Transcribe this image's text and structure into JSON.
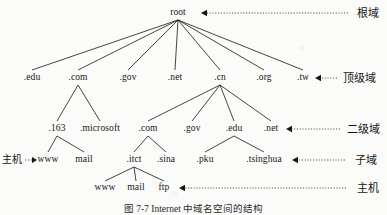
{
  "figure": {
    "caption": "图 7-7  Internet 中域名空间的结构",
    "width": 387,
    "height": 215,
    "ink_color": "#161616",
    "background": "#fbfbfa"
  },
  "nodes": {
    "root": {
      "label": "root",
      "x": 178,
      "y": 13
    },
    "tld": [
      {
        "label": ".edu",
        "x": 32,
        "y": 78
      },
      {
        "label": ".com",
        "x": 78,
        "y": 78
      },
      {
        "label": ".gov",
        "x": 128,
        "y": 78
      },
      {
        "label": ".net",
        "x": 175,
        "y": 78
      },
      {
        "label": ".cn",
        "x": 220,
        "y": 78
      },
      {
        "label": ".org",
        "x": 264,
        "y": 78
      },
      {
        "label": ".tw",
        "x": 303,
        "y": 78
      }
    ],
    "second_level": [
      {
        "label": ".163",
        "x": 57,
        "y": 129
      },
      {
        "label": ".microsoft",
        "x": 100,
        "y": 129
      },
      {
        "label": ".com",
        "x": 148,
        "y": 129
      },
      {
        "label": ".gov",
        "x": 192,
        "y": 129
      },
      {
        "label": ".edu",
        "x": 234,
        "y": 129
      },
      {
        "label": ".net",
        "x": 271,
        "y": 129
      }
    ],
    "sub_domain": [
      {
        "label": "www",
        "x": 48,
        "y": 160
      },
      {
        "label": "mail",
        "x": 84,
        "y": 160
      },
      {
        "label": ".itct",
        "x": 134,
        "y": 160
      },
      {
        "label": ".sina",
        "x": 166,
        "y": 160
      },
      {
        "label": ".pku",
        "x": 205,
        "y": 160
      },
      {
        "label": ".tsinghua",
        "x": 264,
        "y": 160
      }
    ],
    "host": [
      {
        "label": "www",
        "x": 105,
        "y": 188
      },
      {
        "label": "mail",
        "x": 136,
        "y": 188
      },
      {
        "label": "ftp",
        "x": 164,
        "y": 188
      }
    ]
  },
  "level_labels": [
    {
      "name": "root-domain",
      "text": "根域",
      "x": 357,
      "y": 13,
      "arrow_from": 348,
      "arrow_to": 201
    },
    {
      "name": "top-level",
      "text": "顶级域",
      "x": 343,
      "y": 78,
      "arrow_from": 337,
      "arrow_to": 315
    },
    {
      "name": "second-level",
      "text": "二级域",
      "x": 347,
      "y": 129,
      "arrow_from": 340,
      "arrow_to": 286
    },
    {
      "name": "sub-domain",
      "text": "子域",
      "x": 355,
      "y": 160,
      "arrow_from": 345,
      "arrow_to": 292
    },
    {
      "name": "host-level",
      "text": "主机",
      "x": 357,
      "y": 188,
      "arrow_from": 346,
      "arrow_to": 179
    }
  ],
  "side_labels": [
    {
      "name": "host-pointer",
      "text": "主机",
      "x": 24,
      "y": 160,
      "arrow_from": 25,
      "arrow_to": 37
    }
  ],
  "edges": {
    "root_to_tld": [
      [
        178,
        20,
        32,
        70
      ],
      [
        178,
        20,
        78,
        70
      ],
      [
        178,
        20,
        128,
        70
      ],
      [
        178,
        20,
        175,
        70
      ],
      [
        178,
        20,
        220,
        70
      ],
      [
        178,
        20,
        264,
        70
      ],
      [
        178,
        20,
        303,
        70
      ]
    ],
    "com_to_second": [
      [
        78,
        85,
        57,
        121
      ],
      [
        78,
        85,
        100,
        121
      ]
    ],
    "cn_to_second": [
      [
        220,
        85,
        148,
        121
      ],
      [
        220,
        85,
        192,
        121
      ],
      [
        220,
        85,
        234,
        121
      ],
      [
        220,
        85,
        271,
        121
      ]
    ],
    "s163_to_sub": [
      [
        57,
        136,
        48,
        152
      ],
      [
        57,
        136,
        84,
        152
      ]
    ],
    "scom_to_sub": [
      [
        148,
        136,
        134,
        152
      ],
      [
        148,
        136,
        166,
        152
      ]
    ],
    "sedu_to_sub": [
      [
        234,
        136,
        205,
        152
      ],
      [
        234,
        136,
        264,
        152
      ]
    ],
    "itct_to_host": [
      [
        134,
        167,
        105,
        181
      ],
      [
        134,
        167,
        136,
        181
      ],
      [
        134,
        167,
        164,
        181
      ]
    ]
  }
}
